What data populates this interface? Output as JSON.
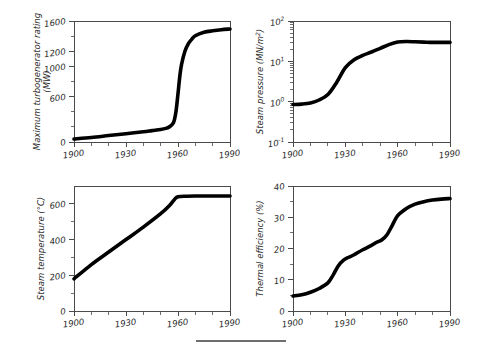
{
  "figure": {
    "background": "#ffffff",
    "curve_color": "#000000",
    "axis_color": "#4a4a4a",
    "rule": {
      "x1": 196,
      "x2": 286,
      "y": 341
    }
  },
  "chart_data": [
    {
      "id": "turbogenerator-rating",
      "type": "line",
      "title": "",
      "xlabel": "",
      "ylabel": "Maximum turbogenerator rating (MW)",
      "ylabel_lines": [
        "Maximum turbogenerator rating",
        "(MW)"
      ],
      "yscale": "linear",
      "xlim": [
        1900,
        1990
      ],
      "ylim": [
        0,
        1600
      ],
      "xticks": [
        1900,
        1930,
        1960,
        1990
      ],
      "xticklabels": [
        "1900",
        "1930",
        "1960",
        "1990"
      ],
      "xtick_minor_step": 10,
      "yticks": [
        0,
        600,
        1000,
        1200,
        1600
      ],
      "yticklabels": [
        "0",
        "600",
        "1000",
        "1200",
        "1600"
      ],
      "ytick_minor": [
        200,
        400,
        800,
        1400
      ],
      "grid": false,
      "x": [
        1900,
        1910,
        1920,
        1930,
        1940,
        1945,
        1950,
        1953,
        1955,
        1957,
        1958,
        1959,
        1960,
        1961,
        1962,
        1964,
        1966,
        1968,
        1970,
        1975,
        1980,
        1985,
        1990
      ],
      "values": [
        40,
        60,
        85,
        110,
        135,
        150,
        165,
        180,
        200,
        240,
        300,
        430,
        640,
        860,
        1020,
        1200,
        1300,
        1360,
        1405,
        1450,
        1470,
        1485,
        1495
      ]
    },
    {
      "id": "steam-pressure",
      "type": "line",
      "title": "",
      "xlabel": "",
      "ylabel": "Steam pressure (MN/m2)",
      "ylabel_parts": {
        "text": "Steam pressure (MN/m",
        "sup": "2",
        "tail": ")"
      },
      "yscale": "log",
      "xlim": [
        1900,
        1990
      ],
      "ylim": [
        0.1,
        100
      ],
      "xticks": [
        1900,
        1930,
        1960,
        1990
      ],
      "xticklabels": [
        "1900",
        "1930",
        "1960",
        "1990"
      ],
      "xtick_minor_step": 10,
      "yticklabels": [
        "10-1",
        "100",
        "101",
        "102"
      ],
      "ytick_exponents": [
        "-1",
        "0",
        "1",
        "2"
      ],
      "grid": false,
      "x": [
        1900,
        1905,
        1910,
        1915,
        1920,
        1925,
        1930,
        1935,
        1940,
        1945,
        1950,
        1955,
        1960,
        1965,
        1970,
        1975,
        1980,
        1985,
        1990
      ],
      "values": [
        0.85,
        0.87,
        0.93,
        1.1,
        1.5,
        3.0,
        7.0,
        11.0,
        14.0,
        17.0,
        21.0,
        26.0,
        30.0,
        31.0,
        30.5,
        30.0,
        29.5,
        29.5,
        29.5
      ]
    },
    {
      "id": "steam-temperature",
      "type": "line",
      "title": "",
      "xlabel": "",
      "ylabel": "Steam temperature (°C)",
      "yscale": "linear",
      "xlim": [
        1900,
        1990
      ],
      "ylim": [
        0,
        700
      ],
      "xticks": [
        1900,
        1930,
        1960,
        1990
      ],
      "xticklabels": [
        "1900",
        "1930",
        "1960",
        "1990"
      ],
      "xtick_minor_step": 10,
      "yticks": [
        0,
        200,
        400,
        600
      ],
      "yticklabels": [
        "0",
        "200",
        "400",
        "600"
      ],
      "ytick_minor": [
        100,
        300,
        500
      ],
      "grid": false,
      "x": [
        1900,
        1910,
        1920,
        1930,
        1940,
        1950,
        1955,
        1958,
        1960,
        1965,
        1970,
        1980,
        1990
      ],
      "values": [
        180,
        260,
        330,
        400,
        470,
        545,
        590,
        625,
        640,
        643,
        644,
        644,
        644
      ]
    },
    {
      "id": "thermal-efficiency",
      "type": "line",
      "title": "",
      "xlabel": "",
      "ylabel": "Thermal efficiency (%)",
      "yscale": "linear",
      "xlim": [
        1900,
        1990
      ],
      "ylim": [
        0,
        40
      ],
      "xticks": [
        1900,
        1930,
        1960,
        1990
      ],
      "xticklabels": [
        "1900",
        "1930",
        "1960",
        "1990"
      ],
      "xtick_minor_step": 10,
      "yticks": [
        0,
        10,
        20,
        30,
        40
      ],
      "yticklabels": [
        "0",
        "10",
        "20",
        "30",
        "40"
      ],
      "ytick_minor": [
        5,
        15,
        25,
        35
      ],
      "grid": false,
      "x": [
        1900,
        1905,
        1910,
        1915,
        1920,
        1923,
        1926,
        1929,
        1932,
        1935,
        1940,
        1945,
        1948,
        1951,
        1954,
        1957,
        1960,
        1965,
        1970,
        1975,
        1980,
        1985,
        1990
      ],
      "values": [
        4.8,
        5.2,
        6.0,
        7.2,
        9.0,
        11.5,
        14.5,
        16.3,
        17.2,
        18.0,
        19.6,
        21.0,
        22.0,
        22.8,
        24.5,
        27.5,
        30.5,
        32.8,
        34.2,
        35.0,
        35.5,
        35.8,
        36.0
      ]
    }
  ]
}
